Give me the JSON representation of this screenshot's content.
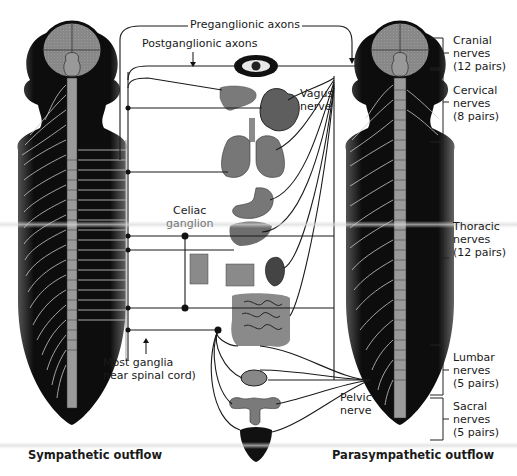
{
  "figure": {
    "labels": {
      "preganglionic": "Preganglionic axons",
      "postganglionic": "Postganglionic axons",
      "vagus_line1": "Vagus",
      "vagus_line2": "nerve",
      "celiac_line1": "Celiac",
      "celiac_line2": "ganglion",
      "most_ganglia_line1": "Most ganglia",
      "most_ganglia_line2": "near spinal cord)",
      "pelvic_line1": "Pelvic",
      "pelvic_line2": "nerve",
      "sympathetic": "Sympathetic outflow",
      "parasympathetic": "Parasympathetic outflow"
    },
    "nerve_groups": [
      {
        "name": "Cranial",
        "line2": "nerves",
        "pairs": "(12 pairs)"
      },
      {
        "name": "Cervical",
        "line2": "nerves",
        "pairs": "(8 pairs)"
      },
      {
        "name": "Thoracic",
        "line2": "nerves",
        "pairs": "(12 pairs)"
      },
      {
        "name": "Lumbar",
        "line2": "nerves",
        "pairs": "(5 pairs)"
      },
      {
        "name": "Sacral",
        "line2": "nerves",
        "pairs": "(5 pairs)"
      }
    ],
    "organs": [
      "eye",
      "salivary-glands",
      "heart",
      "lungs",
      "stomach",
      "liver",
      "adrenal-gland",
      "kidney",
      "intestines",
      "bladder",
      "reproductive-organs",
      "genitals"
    ],
    "colors": {
      "body": "#0d0d0d",
      "brain": "#8a8a8a",
      "organ": "#7a7a7a",
      "nerve_line": "#1a1a1a",
      "spinal_nerve": "#c8c8c8"
    }
  }
}
